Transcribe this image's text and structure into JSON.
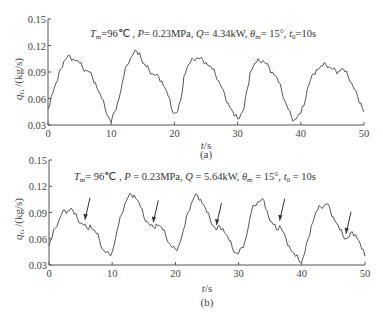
{
  "chart_data": [
    {
      "type": "line",
      "panel": "(a)",
      "annotation": "T_m=96℃, P=0.23MPa, Q=4.34kW, θ_m=15°, t_0=10s",
      "annotation_parts": {
        "T": "T",
        "Tsub": "m",
        "Tval": "=96℃ , ",
        "P": "P",
        "Pval": "= 0.23MPa, ",
        "Q": "Q",
        "Qval": "= 4.34kW, ",
        "th": "θ",
        "thsub": "m",
        "thval": "= 15°, ",
        "t": "t",
        "tsub": "0",
        "tval": "=10s"
      },
      "xlabel": "t/s",
      "ylabel": "q_G /(kg/s)",
      "ylabel_parts": {
        "q": "q",
        "sub": "G",
        "rest": " /(kg/s)"
      },
      "xlim": [
        0,
        50
      ],
      "ylim": [
        0.03,
        0.15
      ],
      "xticks": [
        "0",
        "10",
        "20",
        "30",
        "40",
        "50"
      ],
      "yticks": [
        "0.03",
        "0.06",
        "0.09",
        "0.12",
        "0.15"
      ],
      "caption": "(a)",
      "grid": false,
      "x": [
        0,
        0.5,
        1,
        1.5,
        2,
        2.5,
        3,
        3.5,
        4,
        4.5,
        5,
        5.5,
        6,
        6.5,
        7,
        7.5,
        8,
        8.5,
        9,
        9.5,
        10,
        10.5,
        11,
        11.5,
        12,
        12.5,
        13,
        13.5,
        14,
        14.5,
        15,
        15.5,
        16,
        16.5,
        17,
        17.5,
        18,
        18.5,
        19,
        19.5,
        20,
        20.5,
        21,
        21.5,
        22,
        22.5,
        23,
        23.5,
        24,
        24.5,
        25,
        25.5,
        26,
        26.5,
        27,
        27.5,
        28,
        28.5,
        29,
        29.5,
        30,
        30.5,
        31,
        31.5,
        32,
        32.5,
        33,
        33.5,
        34,
        34.5,
        35,
        35.5,
        36,
        36.5,
        37,
        37.5,
        38,
        38.5,
        39,
        39.5,
        40,
        40.5,
        41,
        41.5,
        42,
        42.5,
        43,
        43.5,
        44,
        44.5,
        45,
        45.5,
        46,
        46.5,
        47,
        47.5,
        48,
        48.5,
        49,
        49.5,
        50
      ],
      "values": [
        0.048,
        0.062,
        0.072,
        0.08,
        0.093,
        0.102,
        0.106,
        0.108,
        0.105,
        0.103,
        0.1,
        0.094,
        0.092,
        0.09,
        0.085,
        0.078,
        0.068,
        0.06,
        0.05,
        0.04,
        0.033,
        0.045,
        0.055,
        0.068,
        0.085,
        0.098,
        0.105,
        0.11,
        0.114,
        0.112,
        0.1,
        0.096,
        0.092,
        0.088,
        0.086,
        0.085,
        0.08,
        0.072,
        0.063,
        0.05,
        0.043,
        0.045,
        0.058,
        0.085,
        0.095,
        0.1,
        0.104,
        0.106,
        0.105,
        0.104,
        0.101,
        0.097,
        0.093,
        0.087,
        0.08,
        0.072,
        0.063,
        0.055,
        0.048,
        0.04,
        0.037,
        0.042,
        0.048,
        0.07,
        0.09,
        0.097,
        0.101,
        0.102,
        0.103,
        0.099,
        0.095,
        0.09,
        0.086,
        0.078,
        0.068,
        0.057,
        0.048,
        0.04,
        0.036,
        0.04,
        0.043,
        0.052,
        0.07,
        0.08,
        0.088,
        0.093,
        0.095,
        0.097,
        0.098,
        0.096,
        0.093,
        0.092,
        0.091,
        0.094,
        0.09,
        0.085,
        0.078,
        0.07,
        0.062,
        0.055,
        0.045
      ]
    },
    {
      "type": "line",
      "panel": "(b)",
      "annotation": "T_m=96℃, P=0.23MPa, Q=5.64kW, θ_m=15°, t_0=10s",
      "annotation_parts": {
        "T": "T",
        "Tsub": "m",
        "Tval": "= 96℃ , ",
        "P": "P",
        "Pval": " = 0.23MPa, ",
        "Q": "Q",
        "Qval": " = 5.64kW, ",
        "th": "θ",
        "thsub": "m",
        "thval": " = 15°, ",
        "t": "t",
        "tsub": "0",
        "tval": " = 10s"
      },
      "xlabel": "t/s",
      "ylabel": "q_G /(kg/s)",
      "ylabel_parts": {
        "q": "q",
        "sub": "G",
        "rest": " /(kg/s)"
      },
      "xlim": [
        0,
        50
      ],
      "ylim": [
        0.03,
        0.15
      ],
      "xticks": [
        "0",
        "10",
        "20",
        "30",
        "40",
        "50"
      ],
      "yticks": [
        "0.03",
        "0.06",
        "0.09",
        "0.12",
        "0.15"
      ],
      "caption": "(b)",
      "grid": false,
      "arrows_at_t": [
        5.7,
        16.5,
        26.5,
        36.5,
        47.0
      ],
      "x": [
        0,
        0.5,
        1,
        1.5,
        2,
        2.5,
        3,
        3.5,
        4,
        4.5,
        5,
        5.5,
        6,
        6.5,
        7,
        7.5,
        8,
        8.5,
        9,
        9.5,
        10,
        10.5,
        11,
        11.5,
        12,
        12.5,
        13,
        13.5,
        14,
        14.5,
        15,
        15.5,
        16,
        16.5,
        17,
        17.5,
        18,
        18.5,
        19,
        19.5,
        20,
        20.5,
        21,
        21.5,
        22,
        22.5,
        23,
        23.5,
        24,
        24.5,
        25,
        25.5,
        26,
        26.5,
        27,
        27.5,
        28,
        28.5,
        29,
        29.5,
        30,
        30.5,
        31,
        31.5,
        32,
        32.5,
        33,
        33.5,
        34,
        34.5,
        35,
        35.5,
        36,
        36.5,
        37,
        37.5,
        38,
        38.5,
        39,
        39.5,
        40,
        40.5,
        41,
        41.5,
        42,
        42.5,
        43,
        43.5,
        44,
        44.5,
        45,
        45.5,
        46,
        46.5,
        47,
        47.5,
        48,
        48.5,
        49,
        49.5,
        50
      ],
      "values": [
        0.052,
        0.062,
        0.072,
        0.08,
        0.088,
        0.093,
        0.092,
        0.095,
        0.088,
        0.083,
        0.078,
        0.076,
        0.072,
        0.076,
        0.07,
        0.066,
        0.058,
        0.048,
        0.044,
        0.043,
        0.045,
        0.06,
        0.075,
        0.088,
        0.1,
        0.107,
        0.111,
        0.11,
        0.104,
        0.096,
        0.085,
        0.08,
        0.075,
        0.073,
        0.077,
        0.075,
        0.07,
        0.063,
        0.055,
        0.05,
        0.048,
        0.052,
        0.062,
        0.075,
        0.09,
        0.1,
        0.108,
        0.11,
        0.105,
        0.098,
        0.09,
        0.082,
        0.075,
        0.07,
        0.075,
        0.072,
        0.065,
        0.058,
        0.05,
        0.044,
        0.043,
        0.05,
        0.057,
        0.072,
        0.09,
        0.098,
        0.102,
        0.103,
        0.104,
        0.092,
        0.08,
        0.076,
        0.07,
        0.075,
        0.068,
        0.06,
        0.052,
        0.045,
        0.04,
        0.036,
        0.034,
        0.045,
        0.06,
        0.075,
        0.085,
        0.093,
        0.096,
        0.098,
        0.1,
        0.093,
        0.085,
        0.078,
        0.07,
        0.064,
        0.06,
        0.062,
        0.068,
        0.065,
        0.058,
        0.048,
        0.04
      ]
    }
  ]
}
